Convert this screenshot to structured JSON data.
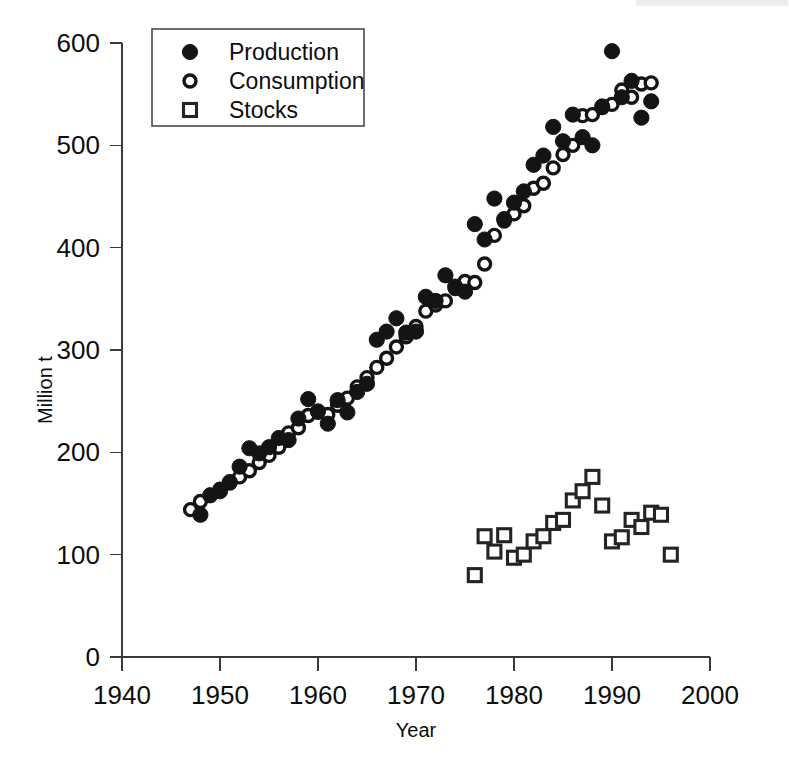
{
  "chart_data": {
    "type": "scatter",
    "title": "",
    "xlabel": "Year",
    "ylabel": "Million t",
    "xlim": [
      1940,
      2000
    ],
    "ylim": [
      0,
      600
    ],
    "xticks": [
      1940,
      1950,
      1960,
      1970,
      1980,
      1990,
      2000
    ],
    "yticks": [
      0,
      100,
      200,
      300,
      400,
      500,
      600
    ],
    "grid": false,
    "legend_position": "top-left",
    "series": [
      {
        "name": "Production",
        "marker": "filled-circle",
        "color": "#141414",
        "points": [
          [
            1948,
            139
          ],
          [
            1949,
            158
          ],
          [
            1950,
            162
          ],
          [
            1951,
            171
          ],
          [
            1952,
            186
          ],
          [
            1953,
            204
          ],
          [
            1954,
            199
          ],
          [
            1955,
            205
          ],
          [
            1956,
            214
          ],
          [
            1957,
            212
          ],
          [
            1958,
            233
          ],
          [
            1959,
            252
          ],
          [
            1960,
            240
          ],
          [
            1961,
            228
          ],
          [
            1962,
            251
          ],
          [
            1963,
            239
          ],
          [
            1964,
            259
          ],
          [
            1965,
            267
          ],
          [
            1966,
            310
          ],
          [
            1967,
            318
          ],
          [
            1968,
            331
          ],
          [
            1969,
            317
          ],
          [
            1970,
            318
          ],
          [
            1971,
            352
          ],
          [
            1972,
            348
          ],
          [
            1973,
            373
          ],
          [
            1974,
            362
          ],
          [
            1975,
            357
          ],
          [
            1976,
            423
          ],
          [
            1977,
            408
          ],
          [
            1978,
            448
          ],
          [
            1979,
            428
          ],
          [
            1980,
            444
          ],
          [
            1981,
            455
          ],
          [
            1982,
            481
          ],
          [
            1983,
            490
          ],
          [
            1984,
            518
          ],
          [
            1985,
            504
          ],
          [
            1986,
            530
          ],
          [
            1987,
            508
          ],
          [
            1988,
            500
          ],
          [
            1989,
            538
          ],
          [
            1990,
            592
          ],
          [
            1991,
            547
          ],
          [
            1992,
            563
          ],
          [
            1993,
            527
          ],
          [
            1994,
            543
          ]
        ]
      },
      {
        "name": "Consumption",
        "marker": "open-circle",
        "color": "#141414",
        "points": [
          [
            1947,
            144
          ],
          [
            1948,
            152
          ],
          [
            1949,
            158
          ],
          [
            1950,
            164
          ],
          [
            1951,
            170
          ],
          [
            1952,
            176
          ],
          [
            1953,
            182
          ],
          [
            1954,
            190
          ],
          [
            1955,
            197
          ],
          [
            1956,
            205
          ],
          [
            1957,
            219
          ],
          [
            1958,
            224
          ],
          [
            1959,
            236
          ],
          [
            1960,
            239
          ],
          [
            1961,
            237
          ],
          [
            1962,
            246
          ],
          [
            1963,
            253
          ],
          [
            1964,
            264
          ],
          [
            1965,
            273
          ],
          [
            1966,
            283
          ],
          [
            1967,
            292
          ],
          [
            1968,
            303
          ],
          [
            1969,
            313
          ],
          [
            1970,
            323
          ],
          [
            1971,
            338
          ],
          [
            1972,
            344
          ],
          [
            1973,
            348
          ],
          [
            1974,
            360
          ],
          [
            1975,
            367
          ],
          [
            1976,
            366
          ],
          [
            1977,
            384
          ],
          [
            1978,
            412
          ],
          [
            1979,
            426
          ],
          [
            1980,
            433
          ],
          [
            1981,
            441
          ],
          [
            1982,
            458
          ],
          [
            1983,
            463
          ],
          [
            1984,
            478
          ],
          [
            1985,
            491
          ],
          [
            1986,
            500
          ],
          [
            1987,
            529
          ],
          [
            1988,
            530
          ],
          [
            1989,
            537
          ],
          [
            1990,
            540
          ],
          [
            1991,
            554
          ],
          [
            1992,
            547
          ],
          [
            1993,
            560
          ],
          [
            1994,
            561
          ]
        ]
      },
      {
        "name": "Stocks",
        "marker": "open-square",
        "color": "#242424",
        "points": [
          [
            1976,
            80
          ],
          [
            1977,
            118
          ],
          [
            1978,
            103
          ],
          [
            1979,
            119
          ],
          [
            1980,
            97
          ],
          [
            1981,
            100
          ],
          [
            1982,
            113
          ],
          [
            1983,
            118
          ],
          [
            1984,
            131
          ],
          [
            1985,
            134
          ],
          [
            1986,
            153
          ],
          [
            1987,
            162
          ],
          [
            1988,
            176
          ],
          [
            1989,
            148
          ],
          [
            1990,
            113
          ],
          [
            1991,
            117
          ],
          [
            1992,
            134
          ],
          [
            1993,
            127
          ],
          [
            1994,
            141
          ],
          [
            1995,
            139
          ],
          [
            1996,
            100
          ]
        ]
      }
    ]
  },
  "axes": {
    "x_tick_labels": [
      "1940",
      "1950",
      "1960",
      "1970",
      "1980",
      "1990",
      "2000"
    ],
    "y_tick_labels": [
      "0",
      "100",
      "200",
      "300",
      "400",
      "500",
      "600"
    ],
    "x_title": "Year",
    "y_title": "Million t"
  },
  "legend": {
    "entries": [
      {
        "label": "Production",
        "marker": "filled-circle-icon"
      },
      {
        "label": "Consumption",
        "marker": "open-circle-icon"
      },
      {
        "label": "Stocks",
        "marker": "open-square-icon"
      }
    ]
  }
}
